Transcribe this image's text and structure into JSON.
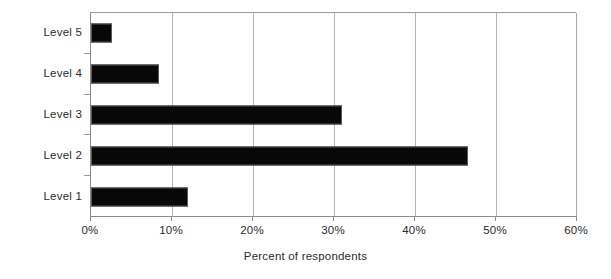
{
  "chart_data": {
    "type": "bar",
    "orientation": "horizontal",
    "title": "",
    "xlabel": "Percent of respondents",
    "ylabel": "",
    "categories": [
      "Level 1",
      "Level 2",
      "Level 3",
      "Level 4",
      "Level 5"
    ],
    "values": [
      12,
      46.5,
      31,
      8.4,
      2.6
    ],
    "xlim": [
      0,
      60
    ],
    "xticks": [
      0,
      10,
      20,
      30,
      40,
      50,
      60
    ],
    "xtick_labels": [
      "0%",
      "10%",
      "20%",
      "30%",
      "40%",
      "50%",
      "60%"
    ],
    "grid": true,
    "grid_axis": "x",
    "legend": false,
    "bar_color": "#080808",
    "grid_color": "#b4b4b4",
    "axis_color": "#8a8a8a",
    "background": "#ffffff",
    "series": [
      {
        "name": "Percent of respondents",
        "values": [
          12,
          46.5,
          31,
          8.4,
          2.6
        ]
      }
    ],
    "points": [
      {
        "category": "Level 5",
        "value": 2.6,
        "label": "2.6%"
      },
      {
        "category": "Level 4",
        "value": 8.4,
        "label": "8.4%"
      },
      {
        "category": "Level 3",
        "value": 31,
        "label": "31%"
      },
      {
        "category": "Level 2",
        "value": 46.5,
        "label": "46.5%"
      },
      {
        "category": "Level 1",
        "value": 12,
        "label": "12%"
      }
    ]
  }
}
